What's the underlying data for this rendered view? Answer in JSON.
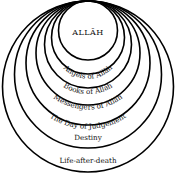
{
  "diagram": {
    "type": "nested-circles",
    "center_label": "ALLĀH",
    "layers": [
      {
        "label": "Angels of Allāh"
      },
      {
        "label": "Books of Allāh"
      },
      {
        "label": "Messengers of Allāh"
      },
      {
        "label": "The Day of Judgement"
      },
      {
        "label": "Destiny"
      },
      {
        "label": "Life-after-death"
      }
    ],
    "colors": {
      "stroke": "#000000",
      "background": "#ffffff"
    }
  }
}
